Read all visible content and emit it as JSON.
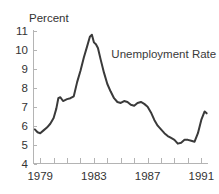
{
  "chart_data": {
    "type": "line",
    "title": "",
    "xlabel": "",
    "ylabel": "Percent",
    "ylim": [
      4,
      11
    ],
    "xlim": [
      1978.5,
      1991.5
    ],
    "grid": false,
    "legend_position": "inside-upper-right",
    "annotations": [
      {
        "text": "Unemployment Rate",
        "x": 1984.3,
        "y": 9.6
      }
    ],
    "y_ticks": [
      4,
      5,
      6,
      7,
      8,
      9,
      10,
      11
    ],
    "y_tick_labels": [
      "4",
      "5",
      "6",
      "7",
      "8",
      "9",
      "10",
      "11"
    ],
    "x_ticks": [
      1979,
      1980,
      1981,
      1982,
      1983,
      1984,
      1985,
      1986,
      1987,
      1988,
      1989,
      1990,
      1991
    ],
    "x_tick_labels_shown": [
      "1979",
      "1983",
      "1987",
      "1991"
    ],
    "x_labeled_ticks": [
      1979,
      1983,
      1987,
      1991
    ],
    "series": [
      {
        "name": "Unemployment Rate",
        "color": "#3a3a3a",
        "x": [
          1978.6,
          1978.8,
          1979.0,
          1979.25,
          1979.5,
          1979.75,
          1980.0,
          1980.2,
          1980.35,
          1980.5,
          1980.7,
          1980.85,
          1981.0,
          1981.25,
          1981.5,
          1981.75,
          1982.0,
          1982.25,
          1982.5,
          1982.7,
          1982.85,
          1983.0,
          1983.15,
          1983.3,
          1983.5,
          1983.75,
          1984.0,
          1984.25,
          1984.5,
          1984.75,
          1985.0,
          1985.25,
          1985.5,
          1985.75,
          1986.0,
          1986.25,
          1986.5,
          1986.75,
          1987.0,
          1987.25,
          1987.5,
          1987.75,
          1988.0,
          1988.25,
          1988.5,
          1988.75,
          1989.0,
          1989.25,
          1989.5,
          1989.75,
          1990.0,
          1990.25,
          1990.5,
          1990.75,
          1991.0,
          1991.25,
          1991.4
        ],
        "y": [
          5.8,
          5.65,
          5.6,
          5.75,
          5.9,
          6.1,
          6.4,
          6.9,
          7.45,
          7.5,
          7.3,
          7.35,
          7.4,
          7.45,
          7.55,
          8.3,
          8.9,
          9.6,
          10.2,
          10.7,
          10.8,
          10.4,
          10.3,
          10.1,
          9.5,
          8.8,
          8.2,
          7.8,
          7.45,
          7.25,
          7.2,
          7.3,
          7.25,
          7.1,
          7.05,
          7.2,
          7.25,
          7.15,
          7.0,
          6.7,
          6.3,
          6.0,
          5.8,
          5.6,
          5.45,
          5.35,
          5.25,
          5.05,
          5.1,
          5.25,
          5.25,
          5.2,
          5.15,
          5.6,
          6.3,
          6.75,
          6.65
        ]
      }
    ]
  }
}
